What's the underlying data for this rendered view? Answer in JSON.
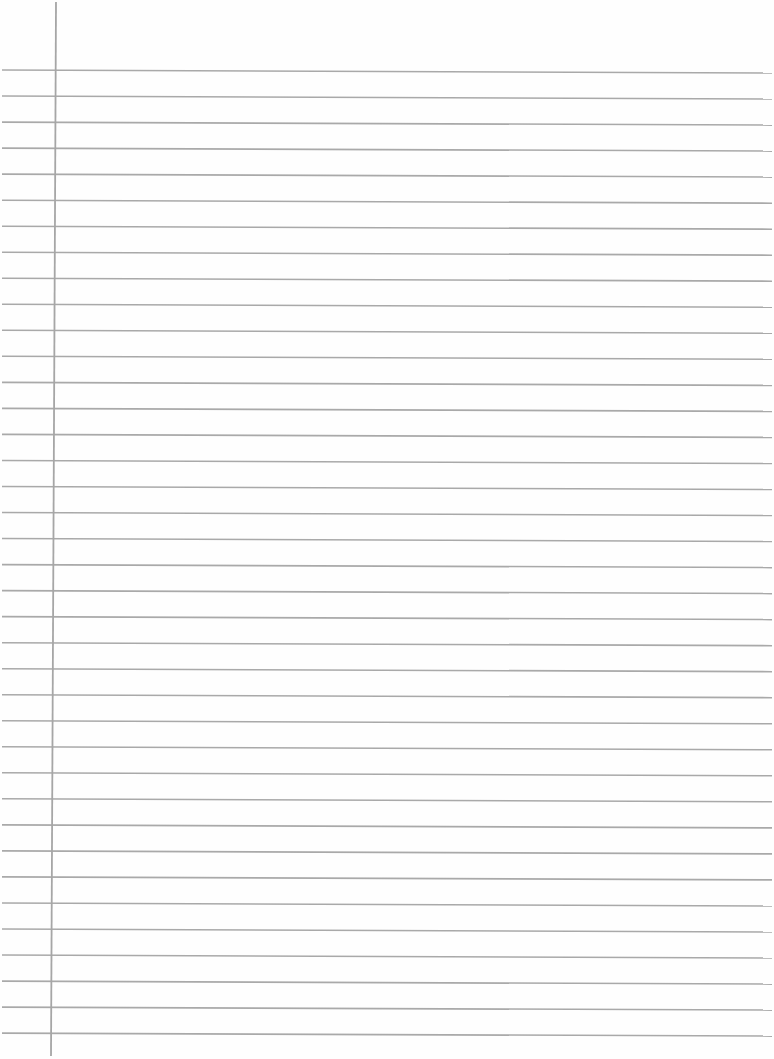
{
  "page": {
    "type": "lined-paper",
    "width": 774,
    "height": 1059,
    "background_color": "#fefefe"
  },
  "ruled_lines": {
    "count": 38,
    "first_y_left": 70,
    "first_y_right": 73,
    "spacing": 26.03,
    "x_start": 2,
    "x_end": 772,
    "color": "#a9a9a9",
    "thickness": 1.6
  },
  "margin_line": {
    "x_top": 56,
    "x_bottom": 51,
    "y_top": 2,
    "y_bottom": 1056,
    "color": "#a6a6a6",
    "thickness": 1.8
  }
}
